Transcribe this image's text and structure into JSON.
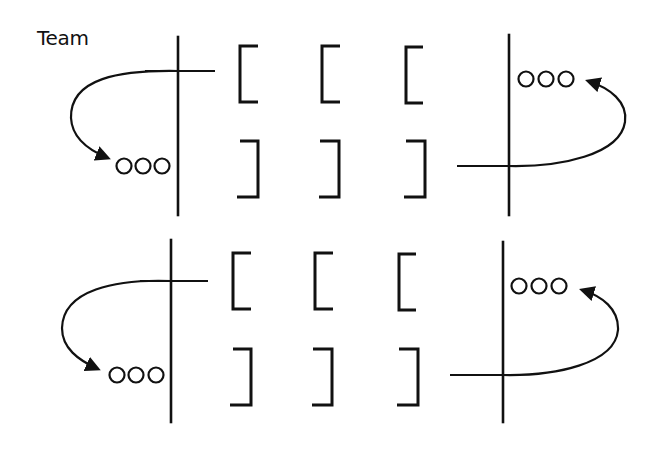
{
  "title": "Team",
  "diagram": {
    "type": "formation-diagram",
    "colors": {
      "ink": "#111111",
      "background": "#ffffff"
    },
    "rows": [
      {
        "name": "row-1",
        "left_group": {
          "players": [
            "O",
            "O",
            "O"
          ],
          "arrow": "curved, from top line to circles"
        },
        "middle_brackets": {
          "top": [
            "[",
            "[",
            "["
          ],
          "bottom": [
            "]",
            "]",
            "]"
          ]
        },
        "right_group": {
          "players": [
            "O",
            "O",
            "O"
          ],
          "arrow": "curved, from bottom line to circles"
        }
      },
      {
        "name": "row-2",
        "left_group": {
          "players": [
            "O",
            "O",
            "O"
          ],
          "arrow": "curved, from top line to circles"
        },
        "middle_brackets": {
          "top": [
            "[",
            "[",
            "["
          ],
          "bottom": [
            "]",
            "]",
            "]"
          ]
        },
        "right_group": {
          "players": [
            "O",
            "O",
            "O"
          ],
          "arrow": "curved, from bottom line to circles"
        }
      }
    ]
  }
}
